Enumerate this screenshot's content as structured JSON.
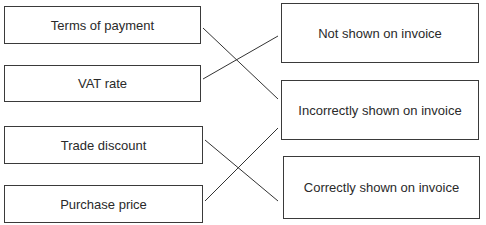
{
  "left_items": [
    {
      "label": "Terms of payment"
    },
    {
      "label": "VAT rate"
    },
    {
      "label": "Trade discount"
    },
    {
      "label": "Purchase price"
    }
  ],
  "right_items": [
    {
      "label": "Not shown on invoice"
    },
    {
      "label": "Incorrectly shown on invoice"
    },
    {
      "label": "Correctly shown on invoice"
    }
  ],
  "connections": [
    {
      "from": "Terms of payment",
      "to": "Incorrectly shown on invoice"
    },
    {
      "from": "VAT rate",
      "to": "Not shown on invoice"
    },
    {
      "from": "Trade discount",
      "to": "Correctly shown on invoice"
    },
    {
      "from": "Purchase price",
      "to": "Incorrectly shown on invoice"
    }
  ]
}
